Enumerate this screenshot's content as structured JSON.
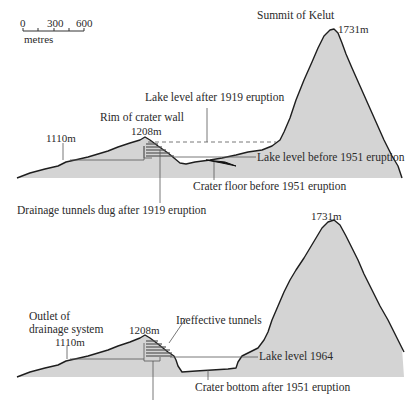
{
  "scale_bar": {
    "ticks": [
      "0",
      "300",
      "600"
    ],
    "unit": "metres"
  },
  "top_panel": {
    "summit_label": "Summit of Kelut",
    "summit_elevation": "1731m",
    "lake_after_1919": "Lake level after 1919 eruption",
    "rim_label": "Rim of crater wall",
    "rim_elevation": "1208m",
    "outlet_elevation": "1110m",
    "lake_before_1951": "Lake level before 1951 eruption",
    "crater_floor_before_1951": "Crater floor before 1951 eruption",
    "drainage_tunnels": "Drainage tunnels dug after 1919 eruption"
  },
  "bottom_panel": {
    "summit_elevation": "1731m",
    "outlet_label_line1": "Outlet of",
    "outlet_label_line2": "drainage system",
    "outlet_elevation": "1110m",
    "rim_elevation": "1208m",
    "ineffective_tunnels": "Ineffective tunnels",
    "lake_1964": "Lake level 1964",
    "crater_bottom_after_1951": "Crater bottom after 1951 eruption"
  },
  "colors": {
    "terrain_fill": "#d4d4d4",
    "outline": "#1e1e1e",
    "text": "#2a2a2a"
  }
}
